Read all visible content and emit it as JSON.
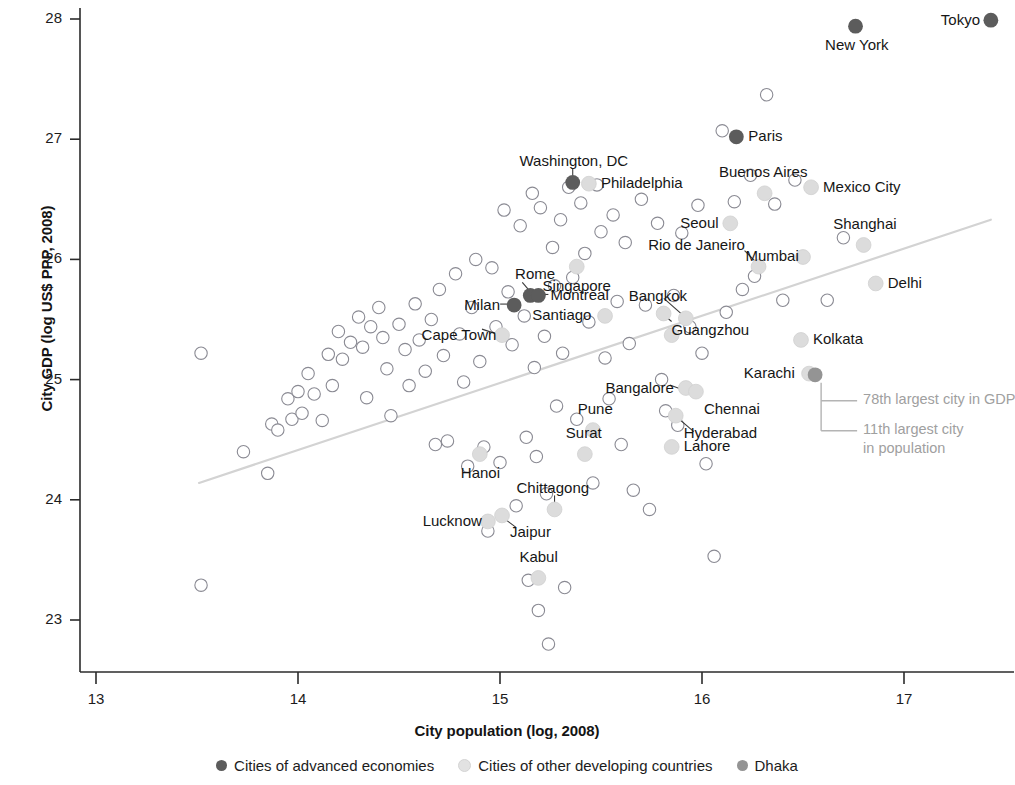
{
  "chart_data": {
    "type": "scatter",
    "title": "",
    "xlabel": "City population (log, 2008)",
    "ylabel": "City GDP (log US$ PPP, 2008)",
    "xlim": [
      12.9,
      17.55
    ],
    "ylim": [
      22.62,
      28.13
    ],
    "xticks": [
      13,
      14,
      15,
      16,
      17
    ],
    "yticks": [
      23,
      24,
      25,
      26,
      27,
      28
    ],
    "xtick_labels": [
      "13",
      "14",
      "15",
      "16",
      "17"
    ],
    "ytick_labels": [
      "23",
      "24",
      "25",
      "26",
      "27",
      "28"
    ],
    "grid": false,
    "legend_position": "below-axis",
    "trendline": {
      "x": [
        13.51,
        17.43
      ],
      "y": [
        24.14,
        26.33
      ],
      "color": "#d3d3d3",
      "style": "solid"
    },
    "series": [
      {
        "name": "Cities of advanced economies",
        "color": "#5c5c5c",
        "marker": "filled-circle",
        "points": [
          {
            "label": "Tokyo",
            "x": 17.43,
            "y": 27.99,
            "label_pos": "left"
          },
          {
            "label": "New York",
            "x": 16.76,
            "y": 27.94,
            "label_pos": "below"
          },
          {
            "label": "Paris",
            "x": 16.17,
            "y": 27.02,
            "label_pos": "right"
          },
          {
            "label": "Washington, DC",
            "x": 15.36,
            "y": 26.64,
            "label_pos": "above"
          },
          {
            "label": "Milan",
            "x": 15.07,
            "y": 25.62,
            "label_pos": "left"
          },
          {
            "label": "Rome",
            "x": 15.15,
            "y": 25.7,
            "label_pos": "above"
          },
          {
            "label": "Montreal",
            "x": 15.19,
            "y": 25.7,
            "label_pos": "right"
          }
        ]
      },
      {
        "name": "Cities of other developing countries",
        "color": "#dcdcdc",
        "marker": "filled-circle-light",
        "points": [
          {
            "label": "Mexico City",
            "x": 16.54,
            "y": 26.6,
            "label_pos": "right"
          },
          {
            "label": "Buenos Aires",
            "x": 16.31,
            "y": 26.55,
            "label_pos": "above"
          },
          {
            "label": "Philadelphia",
            "x": 15.44,
            "y": 26.63,
            "label_pos": "right"
          },
          {
            "label": "Seoul",
            "x": 16.14,
            "y": 26.3,
            "label_pos": "left"
          },
          {
            "label": "Shanghai",
            "x": 16.8,
            "y": 26.12,
            "label_pos": "above"
          },
          {
            "label": "Mumbai",
            "x": 16.5,
            "y": 26.02,
            "label_pos": "left"
          },
          {
            "label": "Rio de Janeiro",
            "x": 16.28,
            "y": 25.94,
            "label_pos": "above-left"
          },
          {
            "label": "Singapore",
            "x": 15.38,
            "y": 25.94,
            "label_pos": "below"
          },
          {
            "label": "Delhi",
            "x": 16.86,
            "y": 25.8,
            "label_pos": "right"
          },
          {
            "label": "Santiago",
            "x": 15.52,
            "y": 25.53,
            "label_pos": "left"
          },
          {
            "label": "Bangkok",
            "x": 15.92,
            "y": 25.51,
            "label_pos": "above-left"
          },
          {
            "label": "Guangzhou",
            "x": 15.81,
            "y": 25.55,
            "label_pos": "below-right"
          },
          {
            "label": "Cape Town",
            "x": 15.01,
            "y": 25.37,
            "label_pos": "left"
          },
          {
            "label": "Kolkata",
            "x": 16.49,
            "y": 25.33,
            "label_pos": "right"
          },
          {
            "label": "Bogota",
            "x": 15.85,
            "y": 25.37,
            "label_pos": "below-left"
          },
          {
            "label": "Karachi",
            "x": 16.53,
            "y": 25.05,
            "label_pos": "left"
          },
          {
            "label": "Bangalore",
            "x": 15.92,
            "y": 24.93,
            "label_pos": "left"
          },
          {
            "label": "Chennai",
            "x": 15.97,
            "y": 24.9,
            "label_pos": "below-right"
          },
          {
            "label": "Hyderabad",
            "x": 15.87,
            "y": 24.7,
            "label_pos": "below-right"
          },
          {
            "label": "Pune",
            "x": 15.46,
            "y": 24.58,
            "label_pos": "above"
          },
          {
            "label": "Lahore",
            "x": 15.85,
            "y": 24.44,
            "label_pos": "right"
          },
          {
            "label": "Surat",
            "x": 15.42,
            "y": 24.38,
            "label_pos": "above"
          },
          {
            "label": "Hanoi",
            "x": 14.9,
            "y": 24.38,
            "label_pos": "below"
          },
          {
            "label": "Chittagong",
            "x": 15.27,
            "y": 23.92,
            "label_pos": "above"
          },
          {
            "label": "Jaipur",
            "x": 15.01,
            "y": 23.87,
            "label_pos": "below-right"
          },
          {
            "label": "Lucknow",
            "x": 14.94,
            "y": 23.82,
            "label_pos": "left"
          },
          {
            "label": "Kabul",
            "x": 15.19,
            "y": 23.35,
            "label_pos": "above"
          }
        ]
      },
      {
        "name": "Dhaka",
        "color": "#949494",
        "marker": "filled-circle-medium",
        "points": [
          {
            "label": "Dhaka",
            "x": 16.56,
            "y": 25.04,
            "label_pos": "none"
          }
        ]
      }
    ],
    "unlabeled_points": {
      "name": "Other cities",
      "color": "#ffffff",
      "edge_color": "#8a8a93",
      "marker": "open-circle",
      "points": [
        {
          "x": 13.52,
          "y": 25.22
        },
        {
          "x": 13.52,
          "y": 23.29
        },
        {
          "x": 13.73,
          "y": 24.4
        },
        {
          "x": 13.85,
          "y": 24.22
        },
        {
          "x": 13.87,
          "y": 24.63
        },
        {
          "x": 13.9,
          "y": 24.58
        },
        {
          "x": 13.95,
          "y": 24.84
        },
        {
          "x": 13.97,
          "y": 24.67
        },
        {
          "x": 14.0,
          "y": 24.9
        },
        {
          "x": 14.02,
          "y": 24.72
        },
        {
          "x": 14.05,
          "y": 25.05
        },
        {
          "x": 14.08,
          "y": 24.88
        },
        {
          "x": 14.12,
          "y": 24.66
        },
        {
          "x": 14.15,
          "y": 25.21
        },
        {
          "x": 14.17,
          "y": 24.95
        },
        {
          "x": 14.2,
          "y": 25.4
        },
        {
          "x": 14.22,
          "y": 25.17
        },
        {
          "x": 14.26,
          "y": 25.31
        },
        {
          "x": 14.3,
          "y": 25.52
        },
        {
          "x": 14.32,
          "y": 25.27
        },
        {
          "x": 14.34,
          "y": 24.85
        },
        {
          "x": 14.36,
          "y": 25.44
        },
        {
          "x": 14.4,
          "y": 25.6
        },
        {
          "x": 14.42,
          "y": 25.35
        },
        {
          "x": 14.44,
          "y": 25.09
        },
        {
          "x": 14.46,
          "y": 24.7
        },
        {
          "x": 14.5,
          "y": 25.46
        },
        {
          "x": 14.53,
          "y": 25.25
        },
        {
          "x": 14.55,
          "y": 24.95
        },
        {
          "x": 14.58,
          "y": 25.63
        },
        {
          "x": 14.6,
          "y": 25.33
        },
        {
          "x": 14.63,
          "y": 25.07
        },
        {
          "x": 14.66,
          "y": 25.5
        },
        {
          "x": 14.68,
          "y": 24.46
        },
        {
          "x": 14.7,
          "y": 25.75
        },
        {
          "x": 14.72,
          "y": 25.2
        },
        {
          "x": 14.74,
          "y": 24.49
        },
        {
          "x": 14.78,
          "y": 25.88
        },
        {
          "x": 14.8,
          "y": 25.38
        },
        {
          "x": 14.82,
          "y": 24.98
        },
        {
          "x": 14.84,
          "y": 24.28
        },
        {
          "x": 14.86,
          "y": 25.6
        },
        {
          "x": 14.88,
          "y": 26.0
        },
        {
          "x": 14.9,
          "y": 25.15
        },
        {
          "x": 14.92,
          "y": 24.44
        },
        {
          "x": 14.94,
          "y": 23.74
        },
        {
          "x": 14.96,
          "y": 25.93
        },
        {
          "x": 14.98,
          "y": 25.44
        },
        {
          "x": 15.0,
          "y": 24.31
        },
        {
          "x": 15.02,
          "y": 26.41
        },
        {
          "x": 15.04,
          "y": 25.73
        },
        {
          "x": 15.06,
          "y": 25.29
        },
        {
          "x": 15.08,
          "y": 23.95
        },
        {
          "x": 15.1,
          "y": 26.28
        },
        {
          "x": 15.12,
          "y": 25.53
        },
        {
          "x": 15.13,
          "y": 24.52
        },
        {
          "x": 15.14,
          "y": 23.33
        },
        {
          "x": 15.16,
          "y": 26.55
        },
        {
          "x": 15.17,
          "y": 25.1
        },
        {
          "x": 15.18,
          "y": 24.36
        },
        {
          "x": 15.19,
          "y": 23.08
        },
        {
          "x": 15.2,
          "y": 26.43
        },
        {
          "x": 15.22,
          "y": 25.36
        },
        {
          "x": 15.23,
          "y": 24.05
        },
        {
          "x": 15.24,
          "y": 22.8
        },
        {
          "x": 15.26,
          "y": 26.1
        },
        {
          "x": 15.27,
          "y": 25.78
        },
        {
          "x": 15.28,
          "y": 24.78
        },
        {
          "x": 15.3,
          "y": 26.33
        },
        {
          "x": 15.31,
          "y": 25.22
        },
        {
          "x": 15.32,
          "y": 23.27
        },
        {
          "x": 15.34,
          "y": 26.6
        },
        {
          "x": 15.36,
          "y": 25.85
        },
        {
          "x": 15.38,
          "y": 24.67
        },
        {
          "x": 15.4,
          "y": 26.47
        },
        {
          "x": 15.42,
          "y": 26.05
        },
        {
          "x": 15.44,
          "y": 25.48
        },
        {
          "x": 15.46,
          "y": 24.14
        },
        {
          "x": 15.48,
          "y": 26.62
        },
        {
          "x": 15.5,
          "y": 26.23
        },
        {
          "x": 15.52,
          "y": 25.18
        },
        {
          "x": 15.54,
          "y": 24.84
        },
        {
          "x": 15.56,
          "y": 26.37
        },
        {
          "x": 15.58,
          "y": 25.65
        },
        {
          "x": 15.6,
          "y": 24.46
        },
        {
          "x": 15.62,
          "y": 26.14
        },
        {
          "x": 15.64,
          "y": 25.3
        },
        {
          "x": 15.66,
          "y": 24.08
        },
        {
          "x": 15.7,
          "y": 26.5
        },
        {
          "x": 15.72,
          "y": 25.62
        },
        {
          "x": 15.74,
          "y": 23.92
        },
        {
          "x": 15.78,
          "y": 26.3
        },
        {
          "x": 15.8,
          "y": 25.0
        },
        {
          "x": 15.82,
          "y": 24.74
        },
        {
          "x": 15.86,
          "y": 25.7
        },
        {
          "x": 15.88,
          "y": 24.62
        },
        {
          "x": 15.9,
          "y": 26.22
        },
        {
          "x": 15.94,
          "y": 25.44
        },
        {
          "x": 15.98,
          "y": 26.45
        },
        {
          "x": 16.0,
          "y": 25.22
        },
        {
          "x": 16.02,
          "y": 24.3
        },
        {
          "x": 16.06,
          "y": 23.53
        },
        {
          "x": 16.1,
          "y": 27.07
        },
        {
          "x": 16.12,
          "y": 25.56
        },
        {
          "x": 16.16,
          "y": 26.48
        },
        {
          "x": 16.2,
          "y": 25.75
        },
        {
          "x": 16.24,
          "y": 26.7
        },
        {
          "x": 16.26,
          "y": 25.86
        },
        {
          "x": 16.32,
          "y": 27.37
        },
        {
          "x": 16.36,
          "y": 26.46
        },
        {
          "x": 16.4,
          "y": 25.66
        },
        {
          "x": 16.46,
          "y": 26.66
        },
        {
          "x": 16.62,
          "y": 25.66
        },
        {
          "x": 16.7,
          "y": 26.18
        }
      ]
    },
    "annotations": [
      {
        "text": "78th largest city in GDP",
        "target": "Dhaka",
        "color": "#a0a0a0"
      },
      {
        "text": "11th largest city",
        "target": "Dhaka",
        "color": "#a0a0a0"
      },
      {
        "text": "in population",
        "target": "Dhaka",
        "color": "#a0a0a0"
      }
    ]
  },
  "legend": {
    "entries": [
      {
        "label": "Cities of advanced economies",
        "color": "#5c5c5c"
      },
      {
        "label": "Cities of other developing countries",
        "color": "#e2e2e2"
      },
      {
        "label": "Dhaka",
        "color": "#949494"
      }
    ]
  }
}
